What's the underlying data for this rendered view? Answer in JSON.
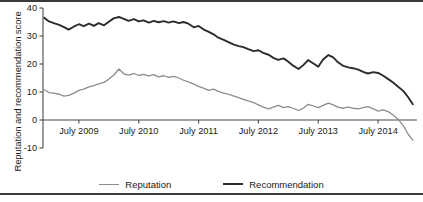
{
  "figure": {
    "background": "#ffffff",
    "frame_color": "#3a3a3a"
  },
  "axis_label": {
    "y": "Reputation and recommendation score"
  },
  "legend": {
    "items": [
      {
        "label": "Reputation",
        "color": "#8c8c8c",
        "width": 1.4
      },
      {
        "label": "Recommendation",
        "color": "#2b2b2b",
        "width": 2.2
      }
    ]
  },
  "chart_data": {
    "type": "line",
    "title": "",
    "xlabel": "",
    "ylabel": "Reputation and recommendation score",
    "xlim": [
      2008.9,
      2015.15
    ],
    "ylim": [
      -10,
      40
    ],
    "yticks": [
      -10,
      0,
      10,
      20,
      30,
      40
    ],
    "ytick_labels": [
      "-10",
      "0",
      "10",
      "20",
      "30",
      "40"
    ],
    "xticks": [
      2009.5,
      2010.5,
      2011.5,
      2012.5,
      2013.5,
      2014.5
    ],
    "xtick_labels": [
      "July 2009",
      "July 2010",
      "July 2011",
      "July 2012",
      "July 2013",
      "July 2014"
    ],
    "grid": false,
    "legend_position": "below",
    "zero_line": true,
    "x": [
      2008.92,
      2009.0,
      2009.08,
      2009.17,
      2009.25,
      2009.33,
      2009.42,
      2009.5,
      2009.58,
      2009.67,
      2009.75,
      2009.83,
      2009.92,
      2010.0,
      2010.08,
      2010.17,
      2010.25,
      2010.33,
      2010.42,
      2010.5,
      2010.58,
      2010.67,
      2010.75,
      2010.83,
      2010.92,
      2011.0,
      2011.08,
      2011.17,
      2011.25,
      2011.33,
      2011.42,
      2011.5,
      2011.58,
      2011.67,
      2011.75,
      2011.83,
      2011.92,
      2012.0,
      2012.08,
      2012.17,
      2012.25,
      2012.33,
      2012.42,
      2012.5,
      2012.58,
      2012.67,
      2012.75,
      2012.83,
      2012.92,
      2013.0,
      2013.08,
      2013.17,
      2013.25,
      2013.33,
      2013.42,
      2013.5,
      2013.58,
      2013.67,
      2013.75,
      2013.83,
      2013.92,
      2014.0,
      2014.08,
      2014.17,
      2014.25,
      2014.33,
      2014.42,
      2014.5,
      2014.58,
      2014.67,
      2014.75,
      2014.83,
      2014.92,
      2015.0,
      2015.08
    ],
    "series": [
      {
        "name": "Recommendation",
        "color": "#2b2b2b",
        "values": [
          36.5,
          35.2,
          34.6,
          34.0,
          33.2,
          32.3,
          33.4,
          34.2,
          33.5,
          34.4,
          33.6,
          34.6,
          33.8,
          35.1,
          36.3,
          36.8,
          36.1,
          35.4,
          36.0,
          35.2,
          35.6,
          34.8,
          35.4,
          34.9,
          35.3,
          34.8,
          35.2,
          34.6,
          35.0,
          34.4,
          33.1,
          33.6,
          32.4,
          31.5,
          30.6,
          29.4,
          28.6,
          27.8,
          27.0,
          26.4,
          26.0,
          25.3,
          24.6,
          24.9,
          24.0,
          23.3,
          22.2,
          21.5,
          22.0,
          20.8,
          19.4,
          18.2,
          19.6,
          21.4,
          20.2,
          19.0,
          21.6,
          23.2,
          22.4,
          20.6,
          19.3,
          18.8,
          18.5,
          18.0,
          17.2,
          16.6,
          17.1,
          16.8,
          15.9,
          14.6,
          13.4,
          12.0,
          10.4,
          8.2,
          5.6
        ]
      },
      {
        "name": "Reputation",
        "color": "#8c8c8c",
        "values": [
          10.8,
          9.8,
          9.6,
          9.2,
          8.5,
          8.8,
          9.6,
          10.6,
          11.0,
          11.8,
          12.3,
          12.9,
          13.4,
          14.6,
          16.0,
          18.2,
          16.5,
          16.0,
          16.6,
          15.9,
          16.3,
          15.8,
          16.2,
          15.4,
          15.8,
          15.2,
          15.6,
          15.0,
          14.2,
          13.6,
          12.8,
          12.0,
          11.4,
          10.6,
          11.0,
          10.2,
          9.6,
          9.2,
          8.6,
          8.0,
          7.4,
          6.8,
          6.2,
          5.4,
          4.6,
          4.0,
          4.6,
          5.2,
          4.4,
          4.8,
          4.2,
          3.4,
          4.2,
          5.6,
          5.0,
          4.4,
          5.2,
          6.0,
          5.4,
          4.6,
          4.2,
          4.6,
          4.2,
          4.0,
          4.4,
          4.8,
          4.0,
          3.2,
          3.6,
          3.0,
          1.8,
          0.4,
          -2.0,
          -5.0,
          -7.2
        ]
      }
    ]
  }
}
